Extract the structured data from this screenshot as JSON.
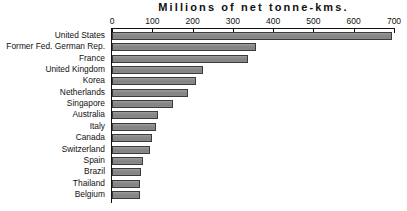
{
  "chart_data": {
    "type": "bar",
    "orientation": "horizontal",
    "title": "Millions of net tonne-kms.",
    "xlabel": "",
    "ylabel": "",
    "xlim": [
      0,
      700
    ],
    "xticks": [
      0,
      100,
      200,
      300,
      400,
      500,
      600,
      700
    ],
    "grid": false,
    "legend": null,
    "bar_color": "#8a8a8a",
    "bar_border_color": "#3b3b3b",
    "axis_color": "#111111",
    "categories": [
      "United States",
      "Former Fed. German Rep.",
      "France",
      "United Kingdom",
      "Korea",
      "Netherlands",
      "Singapore",
      "Australia",
      "Italy",
      "Canada",
      "Switzerland",
      "Spain",
      "Brazil",
      "Thailand",
      "Belgium"
    ],
    "values": [
      695,
      358,
      338,
      225,
      208,
      188,
      152,
      115,
      108,
      100,
      95,
      78,
      72,
      70,
      70
    ]
  }
}
